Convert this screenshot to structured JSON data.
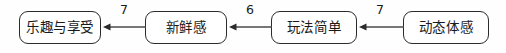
{
  "diagram": {
    "type": "flow-chain",
    "direction": "right-to-left",
    "nodes": [
      {
        "id": "node-0",
        "label": "乐趣与享受"
      },
      {
        "id": "node-1",
        "label": "新鲜感"
      },
      {
        "id": "node-2",
        "label": "玩法简单"
      },
      {
        "id": "node-3",
        "label": "动态体感"
      }
    ],
    "edges": [
      {
        "id": "edge-0",
        "from": "新鲜感",
        "to": "乐趣与享受",
        "label": "7"
      },
      {
        "id": "edge-1",
        "from": "玩法简单",
        "to": "新鲜感",
        "label": "6"
      },
      {
        "id": "edge-2",
        "from": "动态体感",
        "to": "玩法简单",
        "label": "7"
      }
    ],
    "colors": {
      "background": "#fefefe",
      "node_fill": "#ffffff",
      "node_stroke": "#2b2b2b",
      "edge_stroke": "#4a4a4a",
      "text": "#1a1a1a"
    }
  }
}
